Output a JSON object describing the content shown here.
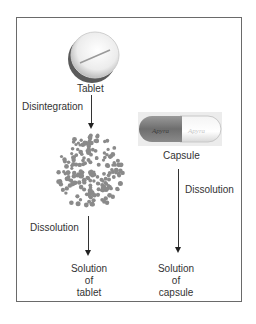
{
  "diagram": {
    "tablet": {
      "label": "Tablet",
      "icon": "tablet-pill-icon"
    },
    "capsule": {
      "label": "Capsule",
      "icon": "capsule-icon",
      "imprint": "Apyra"
    },
    "steps": {
      "disintegration": "Disintegration",
      "dissolution_tablet": "Dissolution",
      "dissolution_capsule": "Dissolution"
    },
    "results": {
      "tablet": [
        "Solution",
        "of",
        "tablet"
      ],
      "capsule": [
        "Solution",
        "of",
        "capsule"
      ]
    },
    "colors": {
      "granules": "#8a8a8a",
      "border": "#6a6a6a",
      "arrow": "#222222"
    }
  }
}
